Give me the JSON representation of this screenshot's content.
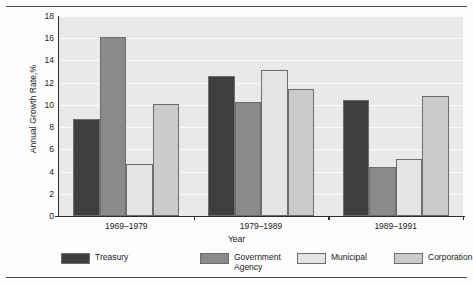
{
  "chart_data": {
    "type": "bar",
    "title": "",
    "subtitle": "",
    "xlabel": "Year",
    "ylabel": "Annual Growth Rate,%",
    "categories": [
      "1969–1979",
      "1979–1989",
      "1989–1991"
    ],
    "series": [
      {
        "name": "Treasury",
        "color": "#3f3f3f",
        "values": [
          8.7,
          12.6,
          10.4
        ]
      },
      {
        "name": "Government\nAgency",
        "color": "#8a8a8a",
        "values": [
          16.1,
          10.3,
          4.4
        ]
      },
      {
        "name": "Municipal",
        "color": "#e4e4e4",
        "values": [
          4.7,
          13.1,
          5.1
        ]
      },
      {
        "name": "Corporation",
        "color": "#cbcbcb",
        "values": [
          10.1,
          11.4,
          10.8
        ]
      }
    ],
    "ylim": [
      0,
      18
    ],
    "yticks": [
      0,
      2,
      4,
      6,
      8,
      10,
      12,
      14,
      16,
      18
    ],
    "ytick_labels": [
      "0",
      "2",
      "4",
      "6",
      "8",
      "10",
      "12",
      "14",
      "16",
      "18"
    ],
    "grid": true,
    "grid_axis": "y",
    "legend_position": "bottom",
    "plot_background": "#e9e9e9",
    "gridline_color": "#fbfbfb",
    "axis_color": "#2b2b2b",
    "bar_edge_color": "#6d6d6d"
  },
  "legend": {
    "entries": [
      {
        "label": "Treasury",
        "color": "#3f3f3f"
      },
      {
        "label": "Government\nAgency",
        "color": "#8a8a8a"
      },
      {
        "label": "Municipal",
        "color": "#e4e4e4"
      },
      {
        "label": "Corporation",
        "color": "#cbcbcb"
      }
    ]
  }
}
